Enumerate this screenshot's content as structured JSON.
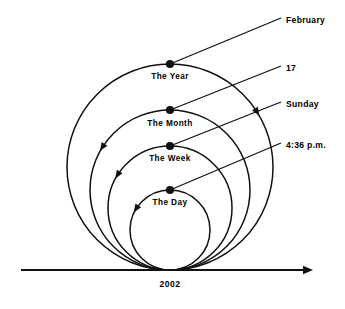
{
  "diagram": {
    "title_present": false,
    "background_color": "#ffffff",
    "stroke_color": "#111111",
    "axis": {
      "label": "2002",
      "arrow_direction": "right",
      "x_start": 21,
      "x_end": 313,
      "y": 270
    },
    "tangent_point": {
      "x": 170,
      "y": 270
    },
    "rings": [
      {
        "key": "year",
        "label": "The Year",
        "radius": 103,
        "center_x": 170,
        "center_y": 167,
        "label_x": 170,
        "label_y": 79,
        "node_x": 170,
        "node_y": 64,
        "arrow_side": "right",
        "callout": "February"
      },
      {
        "key": "month",
        "label": "The Month",
        "radius": 80,
        "center_x": 170,
        "center_y": 190,
        "label_x": 170,
        "label_y": 126,
        "node_x": 170,
        "node_y": 110,
        "arrow_side": "left",
        "callout": "17"
      },
      {
        "key": "week",
        "label": "The Week",
        "radius": 62,
        "center_x": 170,
        "center_y": 208,
        "label_x": 170,
        "label_y": 161,
        "node_x": 170,
        "node_y": 146,
        "arrow_side": "left",
        "callout": "Sunday"
      },
      {
        "key": "day",
        "label": "The Day",
        "radius": 40,
        "center_x": 170,
        "center_y": 230,
        "label_x": 170,
        "label_y": 205,
        "node_x": 170,
        "node_y": 190,
        "arrow_side": "left",
        "callout": "4:36 p.m."
      }
    ],
    "callouts": [
      {
        "key": "february",
        "text": "February",
        "text_x": 286,
        "text_y": 23,
        "line_from_x": 170,
        "line_from_y": 64,
        "line_to_x": 281,
        "line_to_y": 18
      },
      {
        "key": "seventeen",
        "text": "17",
        "text_x": 286,
        "text_y": 71,
        "line_from_x": 170,
        "line_from_y": 110,
        "line_to_x": 281,
        "line_to_y": 66
      },
      {
        "key": "sunday",
        "text": "Sunday",
        "text_x": 286,
        "text_y": 107,
        "line_from_x": 170,
        "line_from_y": 146,
        "line_to_x": 281,
        "line_to_y": 102
      },
      {
        "key": "time",
        "text": "4:36 p.m.",
        "text_x": 286,
        "text_y": 148,
        "line_from_x": 170,
        "line_from_y": 190,
        "line_to_x": 281,
        "line_to_y": 143
      }
    ]
  }
}
